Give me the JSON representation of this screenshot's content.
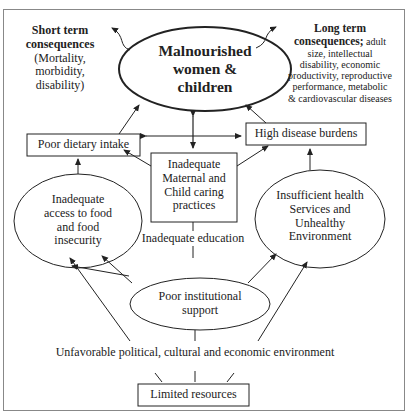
{
  "diagram": {
    "central": {
      "label_line1": "Malnourished",
      "label_line2": "women &",
      "label_line3": "children"
    },
    "short_term": {
      "heading_line1": "Short term",
      "heading_line2": "consequences",
      "body_line1": "(Mortality,",
      "body_line2": "morbidity,",
      "body_line3": "disability)"
    },
    "long_term": {
      "heading_line1": "Long term",
      "heading_line2": "consequences;",
      "body_tail": " adult",
      "body_line2": "size, intellectual",
      "body_line3": "disability, economic",
      "body_line4": "productivity, reproductive",
      "body_line5": "performance, metabolic",
      "body_line6": "& cardiovascular diseases"
    },
    "poor_dietary": {
      "label": "Poor dietary intake"
    },
    "high_disease": {
      "label": "High disease burdens"
    },
    "maternal_care": {
      "line1": "Inadequate",
      "line2": "Maternal and",
      "line3": "Child caring",
      "line4": "practices"
    },
    "food_access": {
      "line1": "Inadequate",
      "line2": "access to food",
      "line3": "and food",
      "line4": "insecurity"
    },
    "health_services": {
      "line1": "Insufficient health",
      "line2": "Services and",
      "line3": "Unhealthy",
      "line4": "Environment"
    },
    "education": {
      "label": "Inadequate education"
    },
    "institutional": {
      "line1": "Poor institutional",
      "line2": "support"
    },
    "environment": {
      "label": "Unfavorable political, cultural and economic environment"
    },
    "resources": {
      "label": "Limited resources"
    },
    "colors": {
      "stroke": "#222222",
      "frame": "#888888",
      "background": "#ffffff"
    }
  }
}
